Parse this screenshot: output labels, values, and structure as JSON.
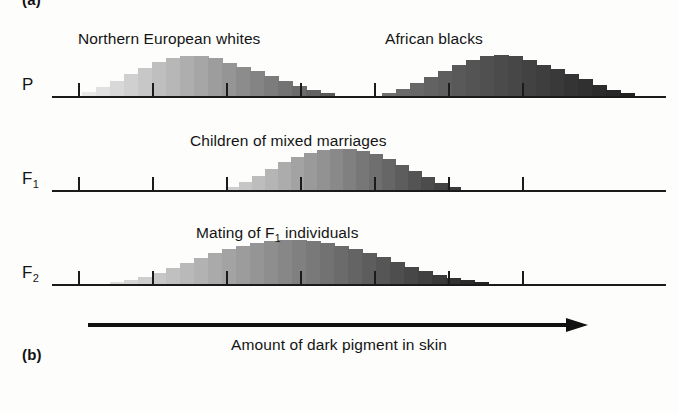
{
  "figure": {
    "panel_tag_top": "(a)",
    "panel_tag_bottom": "(b)",
    "axis_caption": "Amount of dark pigment in skin",
    "arrow_name": "pigment-axis-arrow"
  },
  "rows": [
    {
      "id": "P",
      "label": "P",
      "label_sub": "",
      "captions": [
        {
          "text": "Northern European whites",
          "left": 78,
          "top": 30
        },
        {
          "text": "African blacks",
          "left": 385,
          "top": 30
        }
      ],
      "tick_positions": [
        26,
        100,
        174,
        248,
        322,
        396,
        470
      ],
      "axis_top": 96,
      "distributions": [
        {
          "name": "northern-european-whites",
          "start": 30,
          "bar_width": 14,
          "heights": [
            4,
            9,
            15,
            22,
            28,
            34,
            38,
            40,
            40,
            38,
            33,
            29,
            25,
            20,
            15,
            10,
            6,
            3
          ],
          "shade_from": "#e9e9e9",
          "shade_to": "#5a5a5a"
        },
        {
          "name": "african-blacks",
          "start": 330,
          "bar_width": 14,
          "heights": [
            3,
            7,
            13,
            19,
            25,
            31,
            36,
            40,
            41,
            40,
            36,
            31,
            27,
            22,
            17,
            11,
            6,
            3
          ],
          "shade_from": "#707070",
          "shade_to": "#222222"
        }
      ]
    },
    {
      "id": "F1",
      "label": "F",
      "label_sub": "1",
      "captions": [
        {
          "text": "Children of mixed marriages",
          "left": 190,
          "top": 132
        }
      ],
      "tick_positions": [
        26,
        100,
        174,
        248,
        322,
        396,
        470
      ],
      "axis_top": 190,
      "distributions": [
        {
          "name": "mixed-marriage-children",
          "start": 174,
          "bar_width": 13,
          "heights": [
            3,
            8,
            14,
            21,
            28,
            33,
            37,
            40,
            41,
            41,
            39,
            36,
            31,
            25,
            19,
            13,
            7,
            3
          ],
          "shade_from": "#cfcfcf",
          "shade_to": "#3a3a3a"
        }
      ]
    },
    {
      "id": "F2",
      "label": "F",
      "label_sub": "2",
      "captions": [
        {
          "text": "Mating of F",
          "sub": "1",
          "text2": " individuals",
          "left": 196,
          "top": 224
        }
      ],
      "tick_positions": [
        26,
        100,
        174,
        248,
        322,
        396,
        470
      ],
      "axis_top": 284,
      "distributions": [
        {
          "name": "f2-individuals",
          "start": 58,
          "bar_width": 14,
          "heights": [
            2,
            4,
            7,
            11,
            16,
            21,
            26,
            31,
            35,
            38,
            41,
            43,
            44,
            44,
            43,
            41,
            38,
            35,
            31,
            27,
            22,
            17,
            13,
            9,
            6,
            4,
            2
          ],
          "shade_from": "#dcdcdc",
          "shade_to": "#242424"
        }
      ]
    }
  ],
  "colors": {
    "ink": "#1b1b1b",
    "background": "#fdfdfc"
  }
}
